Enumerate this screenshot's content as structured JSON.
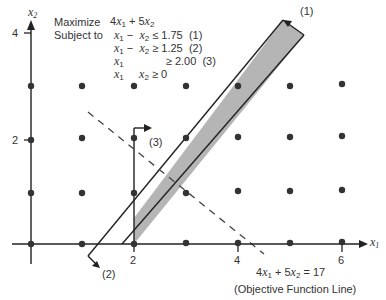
{
  "problem": {
    "objective_label": "Maximize",
    "objective": "4x1 + 5x2",
    "subject_label": "Subject to",
    "constraints": [
      {
        "lhs": "x1 − x2",
        "op": "≤",
        "rhs": "1.75",
        "id": "(1)"
      },
      {
        "lhs": "x1 − x2",
        "op": "≥",
        "rhs": "1.25",
        "id": "(2)"
      },
      {
        "lhs": "x1",
        "op": "≥",
        "rhs": "2.00",
        "id": "(3)"
      },
      {
        "lhs": "x1 , x2",
        "op": "≥",
        "rhs": "0",
        "id": ""
      }
    ]
  },
  "axes": {
    "x_label": "x1",
    "y_label": "x2",
    "x_ticks": [
      "2",
      "4",
      "6"
    ],
    "y_ticks": [
      "2",
      "4"
    ]
  },
  "labels": {
    "c1": "(1)",
    "c2": "(2)",
    "c3": "(3)",
    "objective_line_eq": "4x1 + 5x2 = 17",
    "objective_line_caption": "(Objective Function Line)"
  },
  "colors": {
    "feasible_band": "#b5b5b5",
    "ink": "#333333"
  }
}
